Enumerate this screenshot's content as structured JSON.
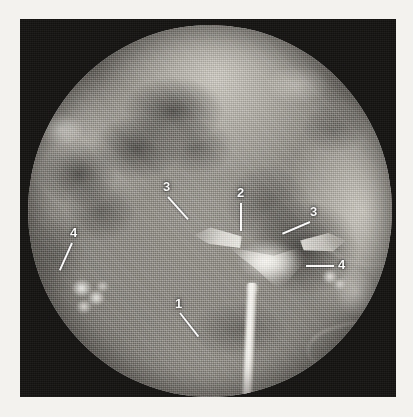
{
  "figure": {
    "kind": "radiograph",
    "modality": "hysterosalpingogram",
    "frame": {
      "background_color": "#151413",
      "border_color": "#f3f2ef"
    },
    "field": {
      "shape": "circle",
      "background_color": "#8a8782"
    },
    "label_color": "#ffffff"
  },
  "annotations": [
    {
      "id": "label-1",
      "text": "1",
      "x": 175,
      "y": 297,
      "leader": {
        "x": 180,
        "y": 312,
        "length": 30,
        "angle": 52
      },
      "target": "catheter-cannula"
    },
    {
      "id": "label-2",
      "text": "2",
      "x": 237,
      "y": 186,
      "leader": {
        "x": 241,
        "y": 202,
        "length": 28,
        "angle": 90
      },
      "target": "uterine-cavity"
    },
    {
      "id": "label-3-left",
      "text": "3",
      "x": 163,
      "y": 180,
      "leader": {
        "x": 168,
        "y": 196,
        "length": 30,
        "angle": 48
      },
      "target": "cornual-horn-left"
    },
    {
      "id": "label-3-right",
      "text": "3",
      "x": 310,
      "y": 205,
      "leader": {
        "x": 310,
        "y": 221,
        "length": 30,
        "angle": 157
      },
      "target": "cornual-horn-right"
    },
    {
      "id": "label-4-left",
      "text": "4",
      "x": 70,
      "y": 226,
      "leader": {
        "x": 72,
        "y": 242,
        "length": 30,
        "angle": 114
      },
      "target": "contrast-spill-left"
    },
    {
      "id": "label-4-right",
      "text": "4",
      "x": 338,
      "y": 258,
      "leader": {
        "x": 306,
        "y": 265,
        "length": 28,
        "angle": 0
      },
      "target": "contrast-spill-right"
    }
  ]
}
